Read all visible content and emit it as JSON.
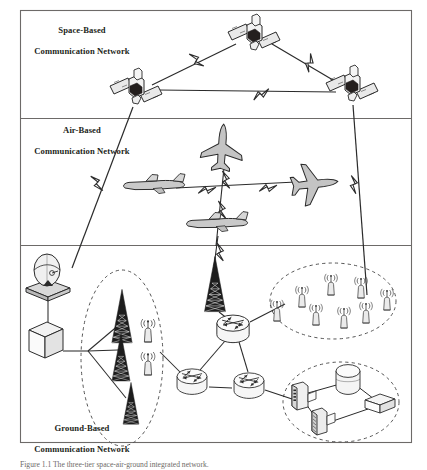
{
  "figure": {
    "kind": "network-architecture-diagram",
    "frame": {
      "x": 20,
      "y": 10,
      "width": 392,
      "height": 433,
      "stroke": "#6d6a68"
    },
    "dividers": [
      118,
      245
    ],
    "tiers": [
      {
        "id": "space",
        "label": "Space-Based\nCommunication Network",
        "label_line1": "Space-Based",
        "label_line2": "Communication Network"
      },
      {
        "id": "air",
        "label": "Air-Based\nCommunication Network",
        "label_line1": "Air-Based",
        "label_line2": "Communication Network"
      },
      {
        "id": "ground",
        "label": "Ground-Based\nCommunication Network",
        "label_line1": "Ground-Based",
        "label_line2": "Communication Network"
      }
    ],
    "caption": "Figure 1.1  The three-tier space-air-ground integrated network.",
    "colors": {
      "line": "#2b2b2b",
      "frame": "#6d6a68",
      "fill_light": "#e8e8e8",
      "fill_mid": "#c9c9c9",
      "fill_dark": "#3a3a3a",
      "text": "#231f20",
      "dashed": "#555555",
      "caption_text": "#6e6a68"
    },
    "nodes": {
      "satellites": [
        {
          "name": "satellite-top",
          "x": 254,
          "y": 38
        },
        {
          "name": "satellite-left",
          "x": 136,
          "y": 92
        },
        {
          "name": "satellite-right",
          "x": 352,
          "y": 89
        }
      ],
      "aircraft": [
        {
          "name": "aircraft-top",
          "x": 222,
          "y": 148,
          "orientation": "nose-up"
        },
        {
          "name": "aircraft-left",
          "x": 152,
          "y": 186,
          "orientation": "facing-left"
        },
        {
          "name": "aircraft-right",
          "x": 312,
          "y": 184,
          "orientation": "facing-right"
        },
        {
          "name": "aircraft-bottom",
          "x": 214,
          "y": 222,
          "orientation": "facing-left"
        }
      ],
      "ground": {
        "satellite-dish": {
          "x": 48,
          "y": 273
        },
        "gateway-server": {
          "x": 45,
          "y": 340
        },
        "uplink-tower": {
          "x": 215,
          "y": 285
        },
        "routers": [
          {
            "name": "router-top",
            "x": 233,
            "y": 327
          },
          {
            "name": "router-bottom-left",
            "x": 193,
            "y": 380
          },
          {
            "name": "router-bottom-right",
            "x": 248,
            "y": 384
          }
        ],
        "cell_towers": [
          {
            "x": 122,
            "y": 317
          },
          {
            "x": 121,
            "y": 357
          },
          {
            "x": 129,
            "y": 404
          }
        ],
        "cell_tower_antennas": [
          {
            "x": 147,
            "y": 330
          },
          {
            "x": 147,
            "y": 362
          }
        ],
        "base_stations": [
          {
            "x": 302,
            "y": 297
          },
          {
            "x": 330,
            "y": 285
          },
          {
            "x": 316,
            "y": 315
          },
          {
            "x": 344,
            "y": 318
          },
          {
            "x": 362,
            "y": 288
          },
          {
            "x": 365,
            "y": 313
          },
          {
            "x": 386,
            "y": 300
          },
          {
            "x": 276,
            "y": 311
          }
        ],
        "datacenter": {
          "workstation": {
            "x": 300,
            "y": 398
          },
          "storage-drum": {
            "x": 348,
            "y": 380
          },
          "server-rack": {
            "x": 318,
            "y": 424
          },
          "network-box": {
            "x": 379,
            "y": 404
          }
        },
        "clusters": [
          {
            "name": "cell-tower-cluster",
            "cx": 122,
            "cy": 358,
            "rx": 40,
            "ry": 88
          },
          {
            "name": "base-station-cluster",
            "cx": 333,
            "cy": 301,
            "rx": 62,
            "ry": 38
          },
          {
            "name": "datacenter-cluster",
            "cx": 341,
            "cy": 401,
            "rx": 58,
            "ry": 40
          }
        ]
      }
    },
    "links": {
      "space_to_space": 3,
      "space_to_ground": 2,
      "air_to_air": 4,
      "air_to_ground": 1,
      "wireless_marker": "lightning-bolt"
    }
  }
}
